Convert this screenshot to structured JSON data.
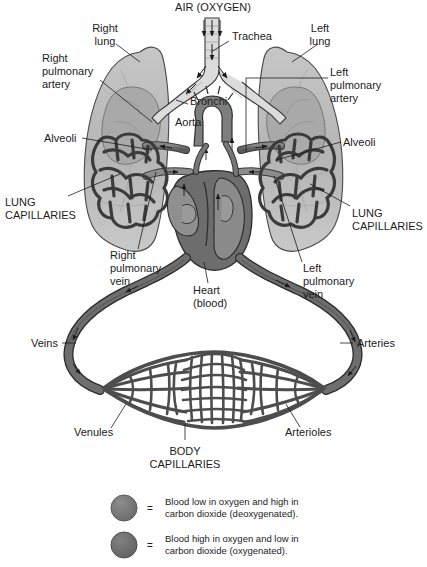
{
  "diagram": {
    "title": "AIR (OXYGEN)",
    "colors": {
      "background": "#ffffff",
      "lung_fill": "#b9b9b9",
      "lung_inner": "#a8a8a8",
      "vessel_deoxy": "#6e6e6e",
      "vessel_oxy": "#8f8f8f",
      "heart_dark": "#5f5f5f",
      "heart_mid": "#8a8a8a",
      "outline": "#1c1c1c",
      "text": "#1c1c1c"
    },
    "labels": [
      {
        "id": "right-lung",
        "text": "Right\nlung",
        "lines": [
          "Right",
          "lung"
        ],
        "x": 105,
        "y": 30,
        "anchor": "middle"
      },
      {
        "id": "trachea",
        "text": "Trachea",
        "lines": [
          "Trachea"
        ],
        "x": 232,
        "y": 38,
        "anchor": "start"
      },
      {
        "id": "left-lung",
        "text": "Left\nlung",
        "lines": [
          "Left",
          "lung"
        ],
        "x": 320,
        "y": 30,
        "anchor": "middle"
      },
      {
        "id": "right-pulmonary-artery",
        "text": "Right\npulmonary\nartery",
        "lines": [
          "Right",
          "pulmonary",
          "artery"
        ],
        "x": 42,
        "y": 58,
        "anchor": "start"
      },
      {
        "id": "left-pulmonary-artery",
        "text": "Left\npulmonary\nartery",
        "lines": [
          "Left",
          "pulmonary",
          "artery"
        ],
        "x": 330,
        "y": 72,
        "anchor": "start"
      },
      {
        "id": "bronchi",
        "text": "Bronchi",
        "lines": [
          "Bronchi"
        ],
        "x": 190,
        "y": 101,
        "anchor": "start"
      },
      {
        "id": "aorta",
        "text": "Aorta",
        "lines": [
          "Aorta"
        ],
        "x": 175,
        "y": 122,
        "anchor": "start"
      },
      {
        "id": "alveoli-right",
        "text": "Alveoli",
        "lines": [
          "Alveoli"
        ],
        "x": 44,
        "y": 141,
        "anchor": "start"
      },
      {
        "id": "alveoli-left",
        "text": "Alveoli",
        "lines": [
          "Alveoli"
        ],
        "x": 343,
        "y": 145,
        "anchor": "start"
      },
      {
        "id": "lung-capillaries-right",
        "text": "LUNG\nCAPILLARIES",
        "lines": [
          "LUNG",
          "CAPILLARIES"
        ],
        "x": 5,
        "y": 203,
        "anchor": "start"
      },
      {
        "id": "lung-capillaries-left",
        "text": "LUNG\nCAPILLARIES",
        "lines": [
          "LUNG",
          "CAPILLARIES"
        ],
        "x": 352,
        "y": 214,
        "anchor": "start"
      },
      {
        "id": "right-pulmonary-vein",
        "text": "Right\npulmonary\nvein",
        "lines": [
          "Right",
          "pulmonary",
          "vein"
        ],
        "x": 110,
        "y": 255,
        "anchor": "start"
      },
      {
        "id": "left-pulmonary-vein",
        "text": "Left\npulmonary\nvein",
        "lines": [
          "Left",
          "pulmonary",
          "vein"
        ],
        "x": 303,
        "y": 268,
        "anchor": "start"
      },
      {
        "id": "heart-blood",
        "text": "Heart\n(blood)",
        "lines": [
          "Heart",
          "(blood)"
        ],
        "x": 193,
        "y": 290,
        "anchor": "start"
      },
      {
        "id": "veins",
        "text": "Veins",
        "lines": [
          "Veins"
        ],
        "x": 31,
        "y": 347,
        "anchor": "start"
      },
      {
        "id": "arteries",
        "text": "Arteries",
        "lines": [
          "Arteries"
        ],
        "x": 355,
        "y": 347,
        "anchor": "start"
      },
      {
        "id": "venules",
        "text": "Venules",
        "lines": [
          "Venules"
        ],
        "x": 74,
        "y": 433,
        "anchor": "start"
      },
      {
        "id": "arterioles",
        "text": "Arterioles",
        "lines": [
          "Arterioles"
        ],
        "x": 285,
        "y": 433,
        "anchor": "start"
      },
      {
        "id": "body-capillaries",
        "text": "BODY\nCAPILLARIES",
        "lines": [
          "BODY",
          "CAPILLARIES"
        ],
        "x": 185,
        "y": 452,
        "anchor": "middle"
      }
    ],
    "legend": {
      "equals": "=",
      "items": [
        {
          "id": "deoxygenated",
          "swatch_color": "#7a7a7a",
          "lines": [
            "Blood low in oxygen and high in",
            "carbon dioxide (deoxygenated)."
          ]
        },
        {
          "id": "oxygenated",
          "swatch_color": "#6e6e6e",
          "lines": [
            "Blood high in oxygen and low in",
            "carbon dioxide (oxygenated)."
          ]
        }
      ]
    }
  }
}
